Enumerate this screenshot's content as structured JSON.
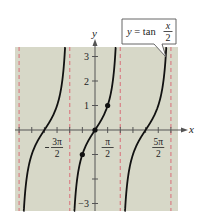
{
  "chart_data": {
    "type": "line",
    "function": "tan(x/2)",
    "xlabel": "x",
    "ylabel": "y",
    "xlim": [
      -3.4,
      3.6
    ],
    "xlim_units": "pi",
    "ylim": [
      -3.3,
      3.5
    ],
    "x_ticks": [
      {
        "value": "-3π/2",
        "label": "-3π/2"
      },
      {
        "value": "π/2",
        "label": "π/2"
      },
      {
        "value": "5π/2",
        "label": "5π/2"
      }
    ],
    "x_tick_marks_step": "π/2",
    "y_ticks": [
      {
        "value": 3,
        "label": "3"
      },
      {
        "value": 2,
        "label": "2"
      },
      {
        "value": 1,
        "label": "1"
      },
      {
        "value": -3,
        "label": "-3"
      }
    ],
    "asymptotes": [
      "-3π",
      "-π",
      "π",
      "3π"
    ],
    "points": [
      {
        "x": "-π/2",
        "y": -1
      },
      {
        "x": "0",
        "y": 0
      },
      {
        "x": "π/2",
        "y": 1
      }
    ],
    "annotation": {
      "text_prefix": "y = tan",
      "frac_num": "x",
      "frac_den": "2"
    },
    "grid": false,
    "colors": {
      "background": "#d7d8c8",
      "curve": "#111111",
      "asymptote": "#d9868a",
      "axis": "#555555"
    }
  }
}
